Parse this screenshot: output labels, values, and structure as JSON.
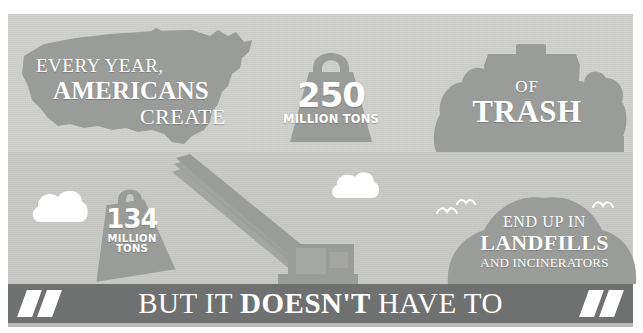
{
  "infographic": {
    "title": "Americans create 250 million tons of trash",
    "colors": {
      "band_top": "#cfd0ce",
      "band_bottom": "#c8c9c6",
      "silhouette": "#9a9c99",
      "banner": "#6f7170",
      "text": "#ffffff"
    }
  },
  "top_band": {
    "us_map": {
      "icon": "usa-map-icon",
      "line1": "EVERY YEAR,",
      "line2": "AMERICANS",
      "line3": "CREATE"
    },
    "weight_250": {
      "icon": "weight-bag-icon",
      "number": "250",
      "unit": "MILLION TONS"
    },
    "trash": {
      "icon": "trash-can-bags-icon",
      "line1": "OF",
      "line2": "TRASH"
    }
  },
  "bottom_band": {
    "weight_134": {
      "icon": "hanging-weight-icon",
      "number": "134",
      "unit_line1": "MILLION",
      "unit_line2": "TONS"
    },
    "crane": {
      "icon": "excavator-crane-icon"
    },
    "landfill": {
      "icon": "landfill-hill-icon",
      "line1": "END UP IN",
      "line2": "LANDFILLS",
      "line3": "AND INCINERATORS"
    },
    "clouds": [
      {
        "icon": "cloud-icon"
      },
      {
        "icon": "cloud-icon"
      }
    ],
    "birds": [
      {
        "icon": "bird-icon"
      },
      {
        "icon": "bird-icon"
      },
      {
        "icon": "bird-icon"
      }
    ]
  },
  "banner": {
    "word1": "BUT",
    "word2": "IT",
    "word3": "DOESN'T",
    "word4": "HAVE",
    "word5": "TO",
    "slash_icon": "slash-mark-icon"
  }
}
